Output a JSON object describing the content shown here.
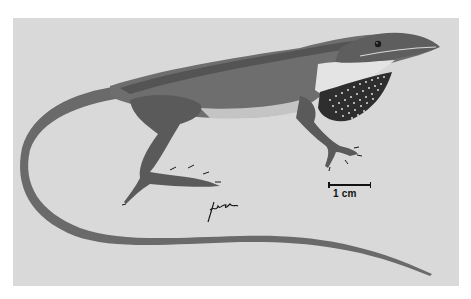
{
  "illustration": {
    "subject": "anole lizard",
    "description": "Grayscale scientific illustration of a lizard in side view with extended spotted dewlap and long tail",
    "colors": {
      "background_panel": "#d9d9d9",
      "body": "#6e6e6e",
      "body_dark": "#4a4a4a",
      "belly": "#c8c8c8",
      "throat": "#e6e6e6",
      "dewlap": "#2e2e2e",
      "dewlap_spots": "#e0e0e0"
    }
  },
  "scale_bar": {
    "label": "1 cm"
  },
  "signature": {
    "text": "Lızall"
  }
}
